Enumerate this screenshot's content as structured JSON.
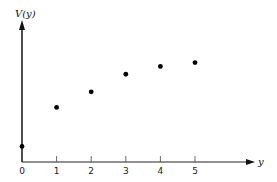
{
  "chart_data": {
    "type": "scatter",
    "title": "",
    "xlabel": "y",
    "ylabel": "V(y)",
    "x": [
      0,
      1,
      2,
      3,
      4,
      5
    ],
    "values": [
      0.8,
      2.8,
      3.6,
      4.5,
      4.9,
      5.1
    ],
    "x_ticks": [
      "0",
      "1",
      "2",
      "3",
      "4",
      "5"
    ],
    "y_ticks": [],
    "xlim": [
      0,
      6.5
    ],
    "ylim": [
      0,
      7
    ],
    "grid": false,
    "legend": null,
    "colors": {
      "axis": "#111111",
      "point": "#000000"
    }
  }
}
